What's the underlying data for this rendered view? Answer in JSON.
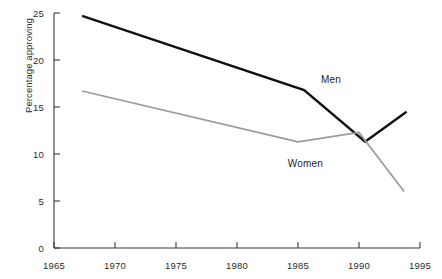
{
  "chart_data": {
    "type": "line",
    "title": "",
    "subtitle": "",
    "xlabel": "",
    "ylabel": "Percentage approving",
    "xlim": [
      1965,
      1995
    ],
    "ylim": [
      0,
      25
    ],
    "xticks": [
      1965,
      1970,
      1975,
      1980,
      1985,
      1990,
      1995
    ],
    "yticks": [
      0,
      5,
      10,
      15,
      20,
      25
    ],
    "xtick_labels": [
      "1965",
      "1970",
      "1975",
      "1980",
      "1985",
      "1990",
      "1995"
    ],
    "ytick_labels": [
      "0",
      "5",
      "10",
      "15",
      "20",
      "25"
    ],
    "grid": false,
    "legend": "inline-annotations",
    "series": [
      {
        "name": "Men",
        "color": "#111111",
        "linewidth": 2.4,
        "x": [
          1967.3,
          1985.5,
          1990.5,
          1993.9
        ],
        "values": [
          24.7,
          16.8,
          11.3,
          14.5
        ]
      },
      {
        "name": "Women",
        "color": "#9a9a9a",
        "linewidth": 1.7,
        "x": [
          1967.3,
          1985.0,
          1990.0,
          1993.7
        ],
        "values": [
          16.7,
          11.3,
          12.3,
          6.0
        ]
      }
    ],
    "annotations": [
      {
        "text": "Men",
        "x": 1987.7,
        "y": 18.0
      },
      {
        "text": "Women",
        "x": 1985.6,
        "y": 9.0
      }
    ]
  },
  "axes": {
    "y_title": "Percentage approving"
  }
}
